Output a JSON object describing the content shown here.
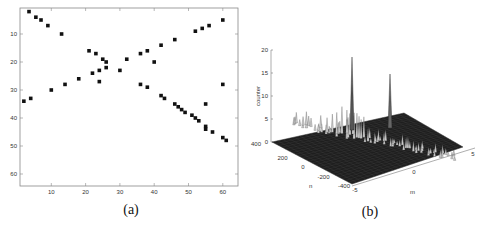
{
  "chart_data": [
    {
      "type": "scatter",
      "panel_caption": "(a)",
      "title": "",
      "xlabel": "",
      "ylabel": "",
      "xlim": [
        0,
        65
      ],
      "ylim": [
        65,
        0
      ],
      "y_reversed": true,
      "grid": false,
      "xticks": [
        10,
        20,
        30,
        40,
        50,
        60
      ],
      "yticks": [
        10,
        20,
        30,
        40,
        50,
        60
      ],
      "marker": "square",
      "points": [
        [
          3.5,
          2
        ],
        [
          5.5,
          4
        ],
        [
          7,
          5
        ],
        [
          9,
          7
        ],
        [
          13,
          10
        ],
        [
          2,
          34
        ],
        [
          4,
          33
        ],
        [
          10,
          30
        ],
        [
          14,
          28
        ],
        [
          18,
          26
        ],
        [
          21,
          16
        ],
        [
          23,
          17
        ],
        [
          25,
          19
        ],
        [
          26,
          20
        ],
        [
          26,
          22
        ],
        [
          24,
          23
        ],
        [
          22,
          24
        ],
        [
          24,
          27
        ],
        [
          30,
          23
        ],
        [
          32,
          19
        ],
        [
          36,
          17
        ],
        [
          38,
          16
        ],
        [
          40,
          20
        ],
        [
          42,
          14
        ],
        [
          46,
          12
        ],
        [
          52,
          9
        ],
        [
          54,
          8
        ],
        [
          56,
          7
        ],
        [
          60,
          5
        ],
        [
          36,
          28
        ],
        [
          38,
          29
        ],
        [
          42,
          32
        ],
        [
          43,
          33
        ],
        [
          46,
          35
        ],
        [
          47,
          36
        ],
        [
          48,
          37
        ],
        [
          49,
          38
        ],
        [
          51,
          39
        ],
        [
          52,
          40
        ],
        [
          53,
          41
        ],
        [
          55,
          43
        ],
        [
          55,
          44
        ],
        [
          57,
          45
        ],
        [
          60,
          47
        ],
        [
          61,
          48
        ],
        [
          55,
          35
        ],
        [
          60,
          28
        ]
      ]
    },
    {
      "type": "surface3d",
      "panel_caption": "(b)",
      "title": "",
      "zlabel": "counter",
      "xlabel": "m",
      "ylabel": "n",
      "zlim": [
        0,
        20
      ],
      "zticks": [
        0,
        5,
        10,
        15,
        20
      ],
      "n_ticks": [
        400,
        200,
        0,
        -200,
        -400
      ],
      "m_ticks": [
        -5,
        0,
        5
      ],
      "peaks": [
        {
          "m": -1,
          "n": 0,
          "counter": 19
        },
        {
          "m": 0.5,
          "n": 150,
          "counter": 15
        }
      ],
      "description": "Dark mesh surface with a ridge of small peaks along n=0 and two tall spikes"
    }
  ]
}
